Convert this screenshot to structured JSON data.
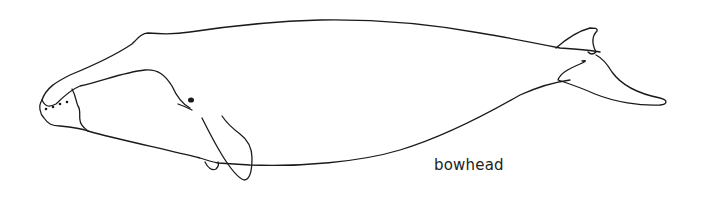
{
  "figure": {
    "caption": "bowhead",
    "colors": {
      "background": "#ffffff",
      "stroke": "#1a1a1a",
      "text": "#222222"
    }
  }
}
